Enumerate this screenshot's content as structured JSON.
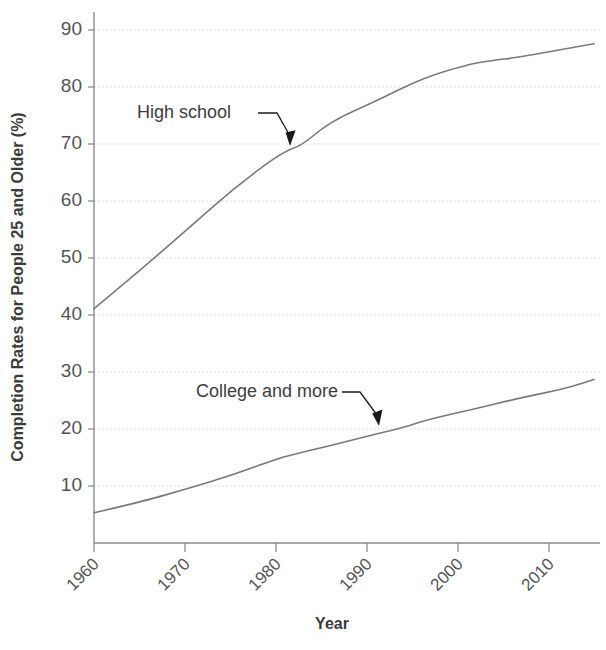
{
  "chart_data": {
    "type": "line",
    "title": "",
    "xlabel": "Year",
    "ylabel": "Completion Rates for People 25 and Older (%)",
    "xlim": [
      1960,
      2013
    ],
    "ylim": [
      0,
      93
    ],
    "xticks": [
      1960,
      1970,
      1980,
      1990,
      2000,
      2010
    ],
    "xticklabels": [
      "1960",
      "1970",
      "1980",
      "1990",
      "2000",
      "2010"
    ],
    "yticks": [
      10,
      20,
      30,
      40,
      50,
      60,
      70,
      80,
      90
    ],
    "yticklabels": [
      "10",
      "20",
      "30",
      "40",
      "50",
      "60",
      "70",
      "80",
      "90"
    ],
    "grid": true,
    "grid_axis": "y",
    "legend": "none",
    "line_color": "#7a7a7a",
    "series": [
      {
        "name": "High school",
        "x": [
          1960,
          1965,
          1970,
          1975,
          1980,
          1982,
          1985,
          1990,
          1995,
          2000,
          2002,
          2005,
          2010,
          2013
        ],
        "values": [
          41.1,
          48.0,
          55.2,
          62.5,
          68.6,
          69.7,
          73.9,
          77.6,
          81.7,
          84.1,
          84.6,
          85.2,
          86.7,
          87.6
        ]
      },
      {
        "name": "College and more",
        "x": [
          1960,
          1965,
          1970,
          1975,
          1980,
          1985,
          1990,
          1993,
          1995,
          2000,
          2005,
          2010,
          2013
        ],
        "values": [
          5.3,
          7.2,
          9.6,
          12.1,
          15.2,
          17.0,
          19.2,
          20.3,
          21.5,
          23.4,
          25.4,
          27.1,
          28.7
        ]
      }
    ],
    "annotations": [
      {
        "text": "High school",
        "target_year": 1982,
        "target_value": 69.7
      },
      {
        "text": "College and more",
        "target_year": 1993,
        "target_value": 20.3
      }
    ]
  }
}
